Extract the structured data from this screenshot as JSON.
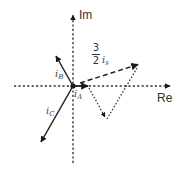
{
  "diagram": {
    "type": "phasor-diagram",
    "axes": {
      "real_label": "Re",
      "imag_label": "Im",
      "origin": [
        73,
        86
      ]
    },
    "vectors": [
      {
        "id": "iA",
        "label_base": "i",
        "label_sub": "A",
        "from": [
          73,
          86
        ],
        "to": [
          88,
          86
        ],
        "style": "solid"
      },
      {
        "id": "iB",
        "label_base": "i",
        "label_sub": "B",
        "from": [
          73,
          86
        ],
        "to": [
          55,
          54
        ],
        "style": "solid"
      },
      {
        "id": "iC",
        "label_base": "i",
        "label_sub": "C",
        "from": [
          73,
          86
        ],
        "to": [
          40,
          144
        ],
        "style": "solid"
      },
      {
        "id": "is",
        "label_coef_num": "3",
        "label_coef_den": "2",
        "label_base": "i",
        "label_sub": "s",
        "from": [
          73,
          86
        ],
        "to": [
          139,
          64
        ],
        "style": "dashed"
      },
      {
        "id": "iB_shifted",
        "from": [
          88,
          86
        ],
        "to": [
          106,
          119
        ],
        "style": "dotted"
      },
      {
        "id": "iC_shifted",
        "from": [
          106,
          119
        ],
        "to": [
          139,
          64
        ],
        "style": "dotted"
      }
    ],
    "colors": {
      "stroke": "#222222",
      "axis": "#333333",
      "text": "#333333"
    }
  }
}
